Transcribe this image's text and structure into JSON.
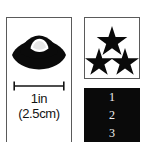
{
  "figure": {
    "background_color": "#ffffff",
    "ink_color": "#0a0a0a",
    "border_color": "#5a5a5a"
  },
  "specimen_panel": {
    "artwork_name": "flying-saucer-silhouette",
    "scale_bar": {
      "unit_label": "1in",
      "metric_label": "(2.5cm)"
    }
  },
  "rating_panel": {
    "star_glyph": "★",
    "star_count": 3,
    "stars": [
      {
        "position": "top-center"
      },
      {
        "position": "bottom-left"
      },
      {
        "position": "bottom-right"
      }
    ]
  },
  "index_strip": {
    "background_color": "#0a0a0a",
    "text_color": "#f2f2f2",
    "items": [
      {
        "label": "1"
      },
      {
        "label": "2"
      },
      {
        "label": "3"
      }
    ]
  }
}
